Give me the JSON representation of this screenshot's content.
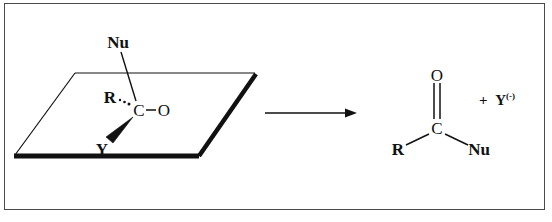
{
  "figure": {
    "kind": "reaction-scheme",
    "background_color": "#ffffff",
    "ink_color": "#111111",
    "frame_color": "#4a4a4a"
  },
  "reactant": {
    "name": "tetrahedral-intermediate-depiction",
    "plane": {
      "name": "trigonal-plane",
      "corner_top_left": [
        75,
        73
      ],
      "corner_top_right": [
        255,
        73
      ],
      "corner_bottom_right": [
        198,
        156
      ],
      "corner_bottom_left": [
        15,
        156
      ]
    },
    "labels": {
      "nucleophile": "Nu",
      "r_group": "R",
      "carbon": "C",
      "oxygen": "O",
      "leaving_group": "Y"
    },
    "bonds": [
      {
        "name": "nu-to-carbon",
        "style": "plain",
        "from": "Nu",
        "to": "C"
      },
      {
        "name": "r-to-carbon",
        "style": "hashed",
        "from": "R",
        "to": "C"
      },
      {
        "name": "carbon-to-oxygen",
        "style": "plain",
        "from": "C",
        "to": "O"
      },
      {
        "name": "carbon-to-y",
        "style": "bold-wedge",
        "from": "C",
        "to": "Y"
      }
    ]
  },
  "arrow": {
    "name": "reaction-arrow",
    "direction": "right",
    "label": ""
  },
  "product": {
    "name": "acyl-substitution-product",
    "labels": {
      "oxygen": "O",
      "carbon": "C",
      "r_group": "R",
      "nucleophile": "Nu"
    },
    "bonds": [
      {
        "name": "carbonyl-double-bond",
        "style": "double",
        "from": "C",
        "to": "O"
      },
      {
        "name": "carbon-to-r",
        "style": "plain",
        "from": "C",
        "to": "R"
      },
      {
        "name": "carbon-to-nu",
        "style": "plain",
        "from": "C",
        "to": "Nu"
      }
    ],
    "byproduct": {
      "plus_sign": "+",
      "symbol": "Y",
      "charge": "(-)"
    }
  }
}
